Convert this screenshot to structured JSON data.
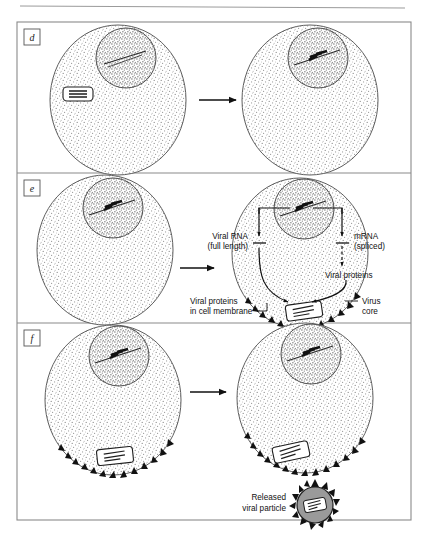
{
  "figure": {
    "title_rule": true,
    "border_color": "#8a8a8a",
    "background": "#ffffff",
    "ink_color": "#111111",
    "cytoplasm_fill": "#e8e8e8",
    "nucleus_fill": "#cfcfcf",
    "virion_fill": "#9a9a9a"
  },
  "panels": [
    {
      "id": "panel-d",
      "label": "d",
      "arrow": "→",
      "cells": [
        {
          "id": "cell-d-left",
          "has_nucleus": true,
          "has_free_core": true,
          "has_membrane_spikes": false
        },
        {
          "id": "cell-d-right",
          "has_nucleus": true,
          "has_free_core": false,
          "has_membrane_spikes": false
        }
      ]
    },
    {
      "id": "panel-e",
      "label": "e",
      "arrow": "→",
      "cells": [
        {
          "id": "cell-e-left",
          "has_nucleus": true,
          "has_free_core": false,
          "has_membrane_spikes": false
        },
        {
          "id": "cell-e-right",
          "has_nucleus": true,
          "has_free_core": false,
          "has_membrane_spikes": true
        }
      ],
      "annotations": [
        {
          "id": "viral-rna",
          "lines": [
            "Viral RNA",
            "(full length)"
          ],
          "align": "right"
        },
        {
          "id": "mrna",
          "lines": [
            "mRNA",
            "(spliced)"
          ],
          "align": "left"
        },
        {
          "id": "viral-proteins",
          "lines": [
            "Viral proteins"
          ],
          "align": "left"
        },
        {
          "id": "viral-proteins-membrane",
          "lines": [
            "Viral proteins",
            "in cell membrane"
          ],
          "align": "right"
        },
        {
          "id": "virus-core",
          "lines": [
            "Virus",
            "core"
          ],
          "align": "left"
        }
      ]
    },
    {
      "id": "panel-f",
      "label": "f",
      "arrow": "→",
      "cells": [
        {
          "id": "cell-f-left",
          "has_nucleus": true,
          "has_free_core": false,
          "has_membrane_spikes": true
        },
        {
          "id": "cell-f-right",
          "has_nucleus": true,
          "has_free_core": false,
          "has_membrane_spikes": true
        }
      ],
      "annotations": [
        {
          "id": "released-particle",
          "lines": [
            "Released",
            "viral particle"
          ],
          "align": "right"
        }
      ]
    }
  ]
}
